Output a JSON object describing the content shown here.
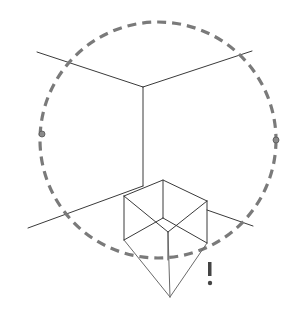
{
  "figure": {
    "title": "",
    "annotation": "!",
    "colors": {
      "background": "#ffffff",
      "line": "#3a3a3a",
      "dashed_circle": "#7a7a7a"
    },
    "elements": {
      "circle": {
        "cx": 158,
        "cy": 140,
        "r": 118,
        "style": "dashed"
      },
      "room_corner": {
        "vertex": [
          143,
          87
        ],
        "lines_to": [
          [
            37,
            52
          ],
          [
            252,
            51
          ],
          [
            143,
            186
          ]
        ]
      },
      "floor_lines": [
        [
          [
            28,
            228
          ],
          [
            143,
            186
          ]
        ],
        [
          [
            207,
            210
          ],
          [
            253,
            226
          ]
        ]
      ],
      "side_marks": [
        [
          42,
          134
        ],
        [
          276,
          140
        ]
      ],
      "cube": {
        "vertices": {
          "top": [
            163,
            180
          ],
          "left_top": [
            124,
            196
          ],
          "right_top": [
            207,
            201
          ],
          "inner": [
            163,
            218
          ],
          "front": [
            168,
            232
          ],
          "left_bottom": [
            124,
            240
          ],
          "right_bottom": [
            207,
            243
          ]
        }
      },
      "apex_point": [
        170,
        297
      ]
    }
  }
}
